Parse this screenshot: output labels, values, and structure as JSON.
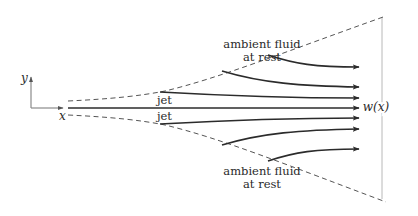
{
  "diagram": {
    "labels": {
      "y_axis": "y",
      "x_axis": "x",
      "width": "w(x)",
      "jet_upper": "jet",
      "jet_lower": "jet",
      "ambient_top_line1": "ambient fluid",
      "ambient_top_line2": "at rest",
      "ambient_bottom_line1": "ambient fluid",
      "ambient_bottom_line2": "at rest"
    },
    "colors": {
      "streamlines": "#2b2b2b",
      "boundary_dashes": "#555555",
      "axes": "#8a8a8a",
      "width_marker": "#b8b8b8",
      "text": "#2a2a2a",
      "background": "#ffffff"
    },
    "elements": {
      "streamlines_count": 7,
      "entrained_streamlines": 4,
      "core_streamlines": 3,
      "boundary": "dashed spreading envelope",
      "width_marker": "vertical line spanning jet width at right end"
    }
  }
}
